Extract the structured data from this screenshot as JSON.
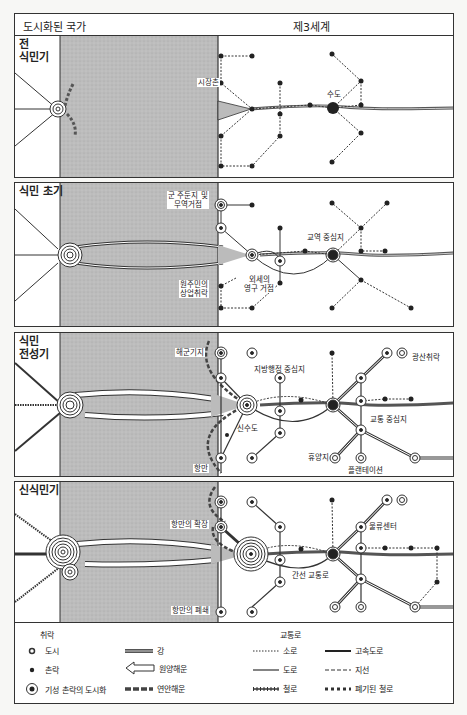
{
  "header": {
    "left_title": "도시화된 국가",
    "right_title": "제3세계"
  },
  "panels": [
    {
      "title_line1": "전",
      "title_line2": "식민기",
      "labels": {
        "market_town": "시장촌",
        "capital": "수도"
      }
    },
    {
      "title": "식민 초기",
      "labels": {
        "garrison_line1": "군 주둔지 및",
        "garrison_line2": "무역거점",
        "trade_center": "교역 중심지",
        "foreign_base_line1": "외세의",
        "foreign_base_line2": "영구 거점",
        "native_line1": "원주민의",
        "native_line2": "상업취락"
      }
    },
    {
      "title_line1": "식민",
      "title_line2": "전성기",
      "labels": {
        "naval_base": "해군기지",
        "regional_admin": "지방행정 중심지",
        "mining": "광산취락",
        "new_capital": "신수도",
        "transport_hub": "교통 중심지",
        "resort": "휴양지",
        "plantation": "플랜테이션",
        "port": "항만"
      }
    },
    {
      "title": "신식민기",
      "labels": {
        "port_expansion": "항만의 확장",
        "logistics": "물류센터",
        "trunk_route": "간선 교통로",
        "port_closure": "항만의 폐쇄"
      }
    }
  ],
  "legend": {
    "settlement_heading": "취락",
    "transport_heading": "교통로",
    "settlement_items": [
      {
        "icon": "city-icon",
        "label": "도시"
      },
      {
        "icon": "village-icon",
        "label": "촌락"
      },
      {
        "icon": "urbanized-village-icon",
        "label": "기성 촌락의 도시화"
      }
    ],
    "water_items": [
      {
        "icon": "river-icon",
        "label": "강"
      },
      {
        "icon": "ocean-shipping-icon",
        "label": "원양해운"
      },
      {
        "icon": "coastal-shipping-icon",
        "label": "연안해운"
      }
    ],
    "transport_items": [
      {
        "icon": "path-icon",
        "label": "소로"
      },
      {
        "icon": "road-icon",
        "label": "도로"
      },
      {
        "icon": "railway-icon",
        "label": "철로"
      }
    ],
    "transport_items2": [
      {
        "icon": "highway-icon",
        "label": "고속도로"
      },
      {
        "icon": "branch-line-icon",
        "label": "지선"
      },
      {
        "icon": "abandoned-railway-icon",
        "label": "폐기된 철로"
      }
    ]
  },
  "colors": {
    "sea": "#bdbdbd",
    "line": "#333333",
    "background": "#ffffff"
  }
}
